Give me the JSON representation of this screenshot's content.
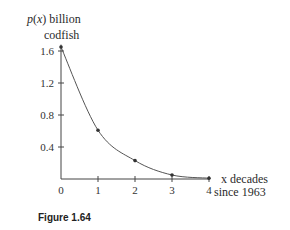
{
  "chart_data": {
    "type": "line",
    "title": "",
    "caption": "Figure 1.64",
    "ylabel_line1": "p(x) billion",
    "ylabel_line2": "codfish",
    "xlabel_line1": "x decades",
    "xlabel_line2": "since 1963",
    "x": [
      0,
      1,
      2,
      3,
      4
    ],
    "series": [
      {
        "name": "p(x)",
        "values": [
          1.65,
          0.61,
          0.23,
          0.05,
          0.01
        ]
      }
    ],
    "xticks": [
      "0",
      "1",
      "2",
      "3",
      "4"
    ],
    "yticks": [
      "0.4",
      "0.8",
      "1.2",
      "1.6"
    ],
    "xlim": [
      0,
      4
    ],
    "ylim": [
      0,
      1.7
    ],
    "grid": false,
    "legend": "none",
    "markers": true
  },
  "colors": {
    "curve": "#555555",
    "axis": "#444444",
    "marker": "#333333"
  }
}
